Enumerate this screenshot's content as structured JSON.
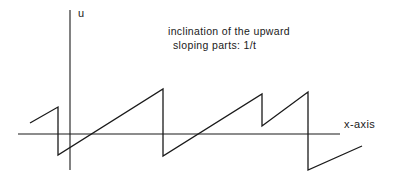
{
  "figure": {
    "background_color": "#ffffff",
    "ink_color": "#1a1a1a",
    "width": 395,
    "height": 187
  },
  "labels": {
    "y_axis": "u",
    "x_axis": "x-axis",
    "annotation_line_1": "inclination of the upward",
    "annotation_line_2": "sloping parts: 1/t"
  },
  "chart_data": {
    "type": "line",
    "title": "",
    "subtitle": "",
    "xlabel": "x-axis",
    "ylabel": "u",
    "grid": false,
    "legend": null,
    "annotations": [
      {
        "text": "inclination of the upward sloping parts: 1/t",
        "x": 168,
        "y": 25
      }
    ],
    "axes": {
      "x_axis_pixel_y": 134,
      "x_axis_pixel_x_start": 18,
      "x_axis_pixel_x_end": 340,
      "y_axis_pixel_x": 70,
      "y_axis_pixel_y_top": 10,
      "y_axis_pixel_y_bottom": 170,
      "origin_pixel": [
        70,
        134
      ]
    },
    "waveform_points": [
      [
        30,
        123
      ],
      [
        58,
        107
      ],
      [
        58,
        155
      ],
      [
        163,
        89
      ],
      [
        163,
        156
      ],
      [
        262,
        94
      ],
      [
        262,
        126
      ],
      [
        308,
        92
      ],
      [
        308,
        170
      ],
      [
        362,
        146
      ]
    ],
    "segments": [
      {
        "kind": "ramp",
        "from": [
          30,
          123
        ],
        "to": [
          58,
          107
        ]
      },
      {
        "kind": "drop",
        "from": [
          58,
          107
        ],
        "to": [
          58,
          155
        ]
      },
      {
        "kind": "ramp",
        "from": [
          58,
          155
        ],
        "to": [
          163,
          89
        ]
      },
      {
        "kind": "drop",
        "from": [
          163,
          89
        ],
        "to": [
          163,
          156
        ]
      },
      {
        "kind": "ramp",
        "from": [
          163,
          156
        ],
        "to": [
          262,
          94
        ]
      },
      {
        "kind": "drop",
        "from": [
          262,
          94
        ],
        "to": [
          262,
          126
        ]
      },
      {
        "kind": "ramp",
        "from": [
          262,
          126
        ],
        "to": [
          308,
          92
        ]
      },
      {
        "kind": "drop",
        "from": [
          308,
          92
        ],
        "to": [
          308,
          170
        ]
      },
      {
        "kind": "ramp",
        "from": [
          308,
          170
        ],
        "to": [
          362,
          146
        ]
      }
    ],
    "series": [
      {
        "name": "u(x)",
        "x": [
          30,
          58,
          58,
          163,
          163,
          262,
          262,
          308,
          308,
          362
        ],
        "values": [
          11,
          27,
          -21,
          45,
          -22,
          40,
          8,
          42,
          -36,
          -12
        ]
      }
    ]
  }
}
